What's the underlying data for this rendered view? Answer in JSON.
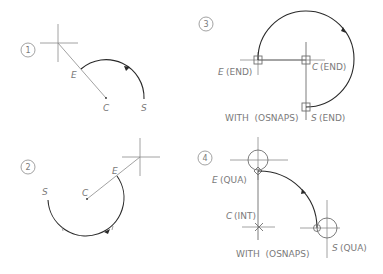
{
  "figure": {
    "panels": [
      {
        "number": "1",
        "labels": {
          "end": "E",
          "center": "C",
          "start": "S"
        }
      },
      {
        "number": "2",
        "labels": {
          "end": "E",
          "center": "C",
          "start": "S"
        }
      },
      {
        "number": "3",
        "labels": {
          "end": "E",
          "end_snap": "(END)",
          "center": "C",
          "center_snap": "(END)",
          "start": "S",
          "start_snap": "(END)"
        },
        "caption": "WITH  (OSNAPS)"
      },
      {
        "number": "4",
        "labels": {
          "end": "E",
          "end_snap": "(QUA)",
          "center": "C",
          "center_snap": "(INT)",
          "start": "S",
          "start_snap": "(QUA)"
        },
        "caption": "WITH  (OSNAPS)"
      }
    ]
  },
  "colors": {
    "arc": "#2a2a2a",
    "construction": "#8a8a8a",
    "text": "#7a7a7a"
  }
}
